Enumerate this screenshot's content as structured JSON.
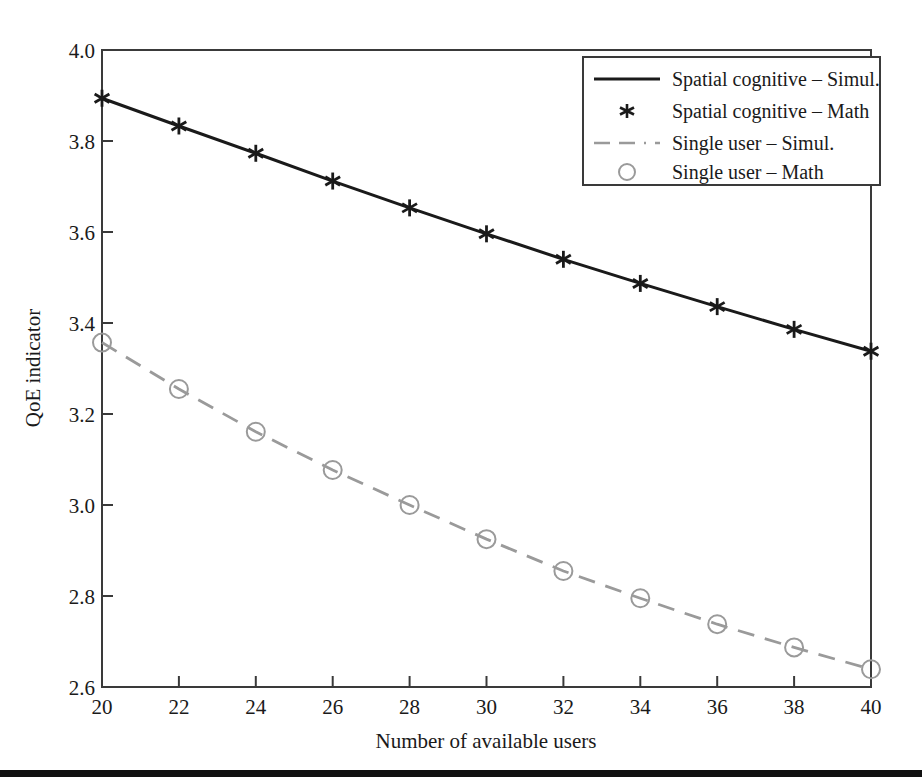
{
  "figure": {
    "background_color": "#ffffff",
    "bottom_rule_color": "#111111"
  },
  "chart_data": {
    "type": "line",
    "title": "",
    "xlabel": "Number of available users",
    "ylabel": "QoE indicator",
    "xlim": [
      20,
      40
    ],
    "ylim": [
      2.6,
      4.0
    ],
    "xticks": [
      20,
      22,
      24,
      26,
      28,
      30,
      32,
      34,
      36,
      38,
      40
    ],
    "xtick_labels": [
      "20",
      "22",
      "24",
      "26",
      "28",
      "30",
      "32",
      "34",
      "36",
      "38",
      "40"
    ],
    "yticks": [
      2.6,
      2.8,
      3.0,
      3.2,
      3.4,
      3.6,
      3.8,
      4.0
    ],
    "ytick_labels": [
      "2.6",
      "2.8",
      "3.0",
      "3.2",
      "3.4",
      "3.6",
      "3.8",
      "4.0"
    ],
    "grid": false,
    "legend_position": "upper right",
    "x": [
      20,
      22,
      24,
      26,
      28,
      30,
      32,
      34,
      36,
      38,
      40
    ],
    "series": [
      {
        "name": "Spatial cognitive – Simul.",
        "style": "solid-line",
        "color": "#1a1a1a",
        "marker": "none",
        "values": [
          3.894,
          3.833,
          3.773,
          3.712,
          3.653,
          3.596,
          3.54,
          3.487,
          3.436,
          3.386,
          3.338
        ]
      },
      {
        "name": "Spatial cognitive – Math",
        "style": "marker-only",
        "color": "#1a1a1a",
        "marker": "asterisk",
        "values": [
          3.894,
          3.833,
          3.773,
          3.712,
          3.653,
          3.596,
          3.54,
          3.487,
          3.436,
          3.386,
          3.338
        ]
      },
      {
        "name": "Single user – Simul.",
        "style": "dashed-line",
        "color": "#9a9a9a",
        "marker": "none",
        "values": [
          3.357,
          3.255,
          3.161,
          3.077,
          3.0,
          2.925,
          2.855,
          2.795,
          2.738,
          2.687,
          2.639
        ]
      },
      {
        "name": "Single user – Math",
        "style": "marker-only",
        "color": "#9a9a9a",
        "marker": "circle",
        "values": [
          3.357,
          3.255,
          3.161,
          3.077,
          3.0,
          2.925,
          2.855,
          2.795,
          2.738,
          2.687,
          2.639
        ]
      }
    ],
    "legend": [
      {
        "label": "Spatial cognitive – Simul.",
        "swatch": "solid-line",
        "color": "#1a1a1a"
      },
      {
        "label": "Spatial cognitive – Math",
        "swatch": "asterisk",
        "color": "#1a1a1a"
      },
      {
        "label": "Single user – Simul.",
        "swatch": "dashed-line",
        "color": "#9a9a9a"
      },
      {
        "label": "Single user – Math",
        "swatch": "circle",
        "color": "#9a9a9a"
      }
    ]
  }
}
